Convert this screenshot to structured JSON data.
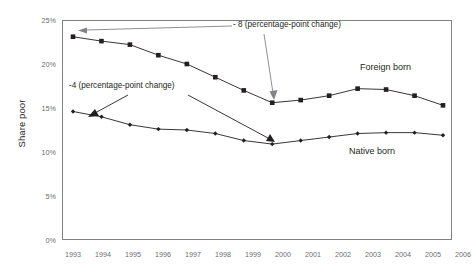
{
  "chart_data": {
    "type": "line",
    "title": "",
    "xlabel": "",
    "ylabel": "Share poor",
    "categories": [
      "1993",
      "1994",
      "1995",
      "1996",
      "1997",
      "1998",
      "1999",
      "2000",
      "2001",
      "2002",
      "2003",
      "2004",
      "2005",
      "2006"
    ],
    "xlim": [
      1993,
      2006
    ],
    "ylim": [
      0,
      25
    ],
    "ytick_labels": [
      "0%",
      "5%",
      "10%",
      "15%",
      "20%",
      "25%"
    ],
    "ytick_values": [
      0,
      5,
      10,
      15,
      20,
      25
    ],
    "grid": false,
    "legend": "inline-labels",
    "series": [
      {
        "name": "Foreign born",
        "marker": "square",
        "color": "#231f20",
        "values": [
          23.1,
          22.6,
          22.2,
          21.0,
          20.0,
          18.5,
          17.0,
          15.6,
          15.9,
          16.4,
          17.2,
          17.1,
          16.4,
          15.3
        ]
      },
      {
        "name": "Native born",
        "marker": "diamond",
        "color": "#231f20",
        "values": [
          14.6,
          14.0,
          13.1,
          12.6,
          12.5,
          12.1,
          11.3,
          10.9,
          11.3,
          11.7,
          12.1,
          12.2,
          12.2,
          11.9
        ]
      }
    ],
    "annotations": [
      {
        "id": "foreign-change",
        "text": "- 8 (percentage-point change)",
        "points_to": [
          "Foreign born 1993",
          "Foreign born 2000"
        ]
      },
      {
        "id": "native-change",
        "text": "-4 (percentage-point change)",
        "points_to": [
          "Native born 1993",
          "Native born 2000"
        ]
      }
    ],
    "series_labels": [
      {
        "id": "foreign-born-label",
        "text": "Foreign born"
      },
      {
        "id": "native-born-label",
        "text": "Native born"
      }
    ]
  },
  "axis": {
    "y_title": "Share poor"
  }
}
